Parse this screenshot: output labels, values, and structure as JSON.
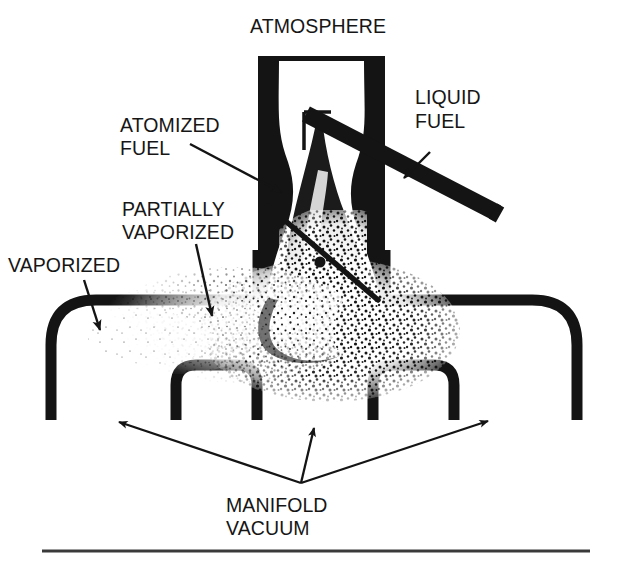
{
  "figure": {
    "type": "technical-diagram",
    "background_color": "#ffffff",
    "ink_color": "#141414"
  },
  "labels": {
    "atmosphere": "ATMOSPHERE",
    "liquid_fuel_line1": "LIQUID",
    "liquid_fuel_line2": "FUEL",
    "atomized_fuel_line1": "ATOMIZED",
    "atomized_fuel_line2": "FUEL",
    "partially_vaporized_line1": "PARTIALLY",
    "partially_vaporized_line2": "VAPORIZED",
    "vaporized": "VAPORIZED",
    "manifold_vacuum_line1": "MANIFOLD",
    "manifold_vacuum_line2": "VACUUM"
  },
  "callouts": [
    {
      "name": "atmosphere",
      "text": "ATMOSPHERE",
      "has_leader": false,
      "anchor": "top-center"
    },
    {
      "name": "liquid-fuel",
      "text": "LIQUID FUEL",
      "has_leader": true,
      "arrow_direction": "down-left",
      "points_to": "fuel-delivery-tube"
    },
    {
      "name": "atomized-fuel",
      "text": "ATOMIZED FUEL",
      "has_leader": true,
      "arrow_direction": "down-right",
      "points_to": "venturi-spray-origin"
    },
    {
      "name": "partially-vaporized",
      "text": "PARTIALLY VAPORIZED",
      "has_leader": true,
      "arrow_direction": "down-right",
      "points_to": "mid-manifold-stipple"
    },
    {
      "name": "vaporized",
      "text": "VAPORIZED",
      "has_leader": true,
      "arrow_direction": "down",
      "points_to": "left-manifold-bend"
    },
    {
      "name": "manifold-vacuum",
      "text": "MANIFOLD VACUUM",
      "has_leader": true,
      "arrow_count": 3,
      "arrow_direction": "fan-up-left-up-up-right",
      "points_to": "manifold-runners"
    }
  ],
  "parts": [
    {
      "name": "carburetor-throat",
      "description": "Vertical bore open to atmosphere at top"
    },
    {
      "name": "venturi",
      "description": "Narrowed waist of the carburetor bore"
    },
    {
      "name": "fuel-delivery-tube",
      "description": "Thick diagonal tube entering the bore from upper right"
    },
    {
      "name": "fuel-spray-plume",
      "description": "Dark conical spray descending from the venturi"
    },
    {
      "name": "intake-manifold",
      "description": "Horizontal plenum with rounded end bends"
    },
    {
      "name": "manifold-runner-left",
      "description": "Inverted-U runner branch"
    },
    {
      "name": "manifold-runner-right",
      "description": "Inverted-U runner branch"
    },
    {
      "name": "stipple-cloud",
      "description": "Speckled droplet field spreading left through the manifold"
    },
    {
      "name": "baseline-rule",
      "description": "Horizontal rule across the bottom of the figure"
    }
  ]
}
